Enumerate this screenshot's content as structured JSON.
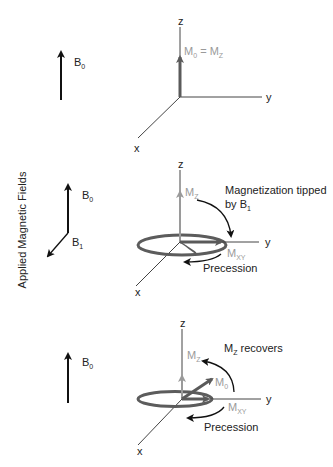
{
  "side_label": "Applied Magnetic Fields",
  "colors": {
    "field_arrow": "#111111",
    "axis": "#444444",
    "magnetization_z": "#9a9a9a",
    "magnetization": "#5a5a5a",
    "ring": "#5c5c5c",
    "text": "#222222",
    "text_gray": "#9a9a9a"
  },
  "panels": [
    {
      "field": {
        "b0": "B",
        "b0_sub": "0"
      },
      "axes": {
        "z": "z",
        "y": "y",
        "x": "x"
      },
      "label_m0": "M",
      "label_m0_sub": "0",
      "label_eq": " = ",
      "label_mz": "M",
      "label_mz_sub": "Z"
    },
    {
      "field": {
        "b0": "B",
        "b0_sub": "0",
        "b1": "B",
        "b1_sub": "1"
      },
      "axes": {
        "z": "z",
        "y": "y",
        "x": "x"
      },
      "label_mz": "M",
      "label_mz_sub": "Z",
      "label_mxy": "M",
      "label_mxy_sub": "XY",
      "annotation_line1": "Magnetization tipped",
      "annotation_line2": "by B",
      "annotation_line2_sub": "1",
      "precession": "Precession"
    },
    {
      "field": {
        "b0": "B",
        "b0_sub": "0"
      },
      "axes": {
        "z": "z",
        "y": "y",
        "x": "x"
      },
      "label_mz": "M",
      "label_mz_sub": "Z",
      "label_m0": "M",
      "label_m0_sub": "0",
      "label_mxy": "M",
      "label_mxy_sub": "XY",
      "annotation": "M",
      "annotation_sub": "Z",
      "annotation_rest": " recovers",
      "precession": "Precession"
    }
  ]
}
